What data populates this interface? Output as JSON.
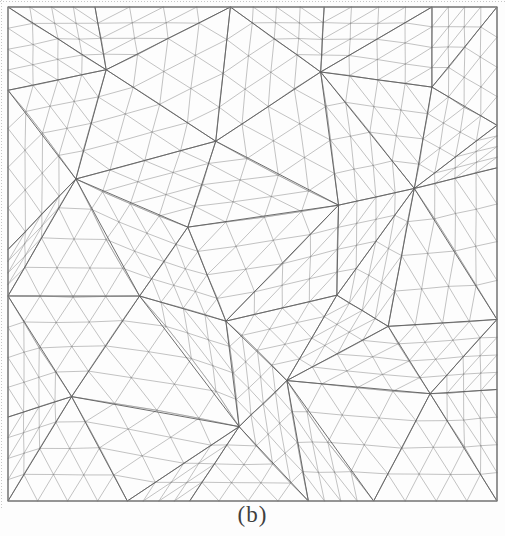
{
  "figure": {
    "caption": "(b)",
    "caption_color": "#3f3f3f",
    "background": "#fdfdfd"
  },
  "mesh": {
    "frame": {
      "x": 8,
      "y": 7,
      "width": 489,
      "height": 494
    },
    "grid_cols": 6,
    "grid_rows": 6,
    "subdivisions": 4,
    "points": [
      [
        0.0,
        0.0
      ],
      [
        0.175,
        0.0
      ],
      [
        0.46,
        0.0
      ],
      [
        0.65,
        0.0
      ],
      [
        0.865,
        0.0
      ],
      [
        1.0,
        0.0
      ],
      [
        0.0,
        0.17
      ],
      [
        0.2,
        0.13
      ],
      [
        0.43,
        0.27
      ],
      [
        0.64,
        0.13
      ],
      [
        0.865,
        0.16
      ],
      [
        1.0,
        0.24
      ],
      [
        0.0,
        0.49
      ],
      [
        0.14,
        0.35
      ],
      [
        0.37,
        0.44
      ],
      [
        0.67,
        0.4
      ],
      [
        0.83,
        0.37
      ],
      [
        1.0,
        0.33
      ],
      [
        0.0,
        0.58
      ],
      [
        0.27,
        0.58
      ],
      [
        0.44,
        0.64
      ],
      [
        0.67,
        0.59
      ],
      [
        0.78,
        0.65
      ],
      [
        1.0,
        0.63
      ],
      [
        0.0,
        0.83
      ],
      [
        0.13,
        0.79
      ],
      [
        0.47,
        0.85
      ],
      [
        0.57,
        0.76
      ],
      [
        0.865,
        0.78
      ],
      [
        1.0,
        0.77
      ],
      [
        0.0,
        1.0
      ],
      [
        0.24,
        1.0
      ],
      [
        0.37,
        1.0
      ],
      [
        0.62,
        1.0
      ],
      [
        0.75,
        1.0
      ],
      [
        1.0,
        1.0
      ]
    ],
    "warp": {
      "amp_x": 3.0,
      "amp_y": 3.2,
      "fx": [
        1.2,
        0.9
      ],
      "phx": 0.7,
      "fy": [
        0.85,
        1.4
      ],
      "phy": 2.1,
      "jitter": 0.45
    },
    "colors": {
      "fine_edge": "#9a9a9a",
      "coarse_edge": "#5f5f5f",
      "node": "#858585",
      "border": "#858585",
      "crop_mark": "#a8a8a8"
    },
    "stroke_widths": {
      "fine": 0.6,
      "coarse": 1.0,
      "border": 1.0
    }
  }
}
